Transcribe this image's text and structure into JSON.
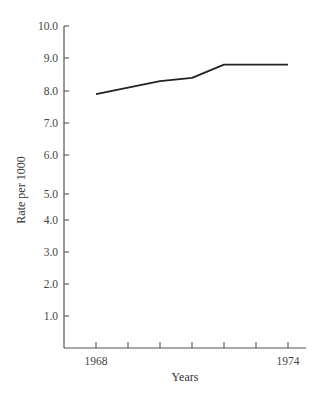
{
  "chart_data": {
    "type": "line",
    "title": "",
    "xlabel": "Years",
    "ylabel": "Rate per 1000",
    "x": [
      1968,
      1969,
      1970,
      1971,
      1972,
      1973,
      1974
    ],
    "series": [
      {
        "name": "Rate",
        "values": [
          7.9,
          8.1,
          8.3,
          8.4,
          8.8,
          8.8,
          8.8
        ]
      }
    ],
    "x_tick_labels": [
      "1968",
      "1974"
    ],
    "x_ticks": [
      1968,
      1969,
      1970,
      1971,
      1972,
      1973,
      1974
    ],
    "y_tick_labels": [
      "1.0",
      "2.0",
      "3.0",
      "4.0",
      "5.0",
      "6.0",
      "7.0",
      "8.0",
      "9.0",
      "10.0"
    ],
    "ylim": [
      0,
      10
    ],
    "xlim": [
      1967,
      1974.6
    ],
    "grid": false,
    "legend": null,
    "line_color": "#222222",
    "axis_color": "#555555"
  },
  "layout": {
    "y_tick_pixels": {
      "1.0": 316,
      "2.0": 284,
      "3.0": 252,
      "4.0": 220,
      "5.0": 194,
      "6.0": 155,
      "7.0": 123,
      "8.0": 91,
      "9.0": 58,
      "10.0": 26
    },
    "x_axis_y": 348,
    "y_axis_x": 64,
    "x_axis_end": 306,
    "x_tick_pixels": [
      96,
      128,
      160,
      192,
      224,
      256,
      288
    ]
  }
}
